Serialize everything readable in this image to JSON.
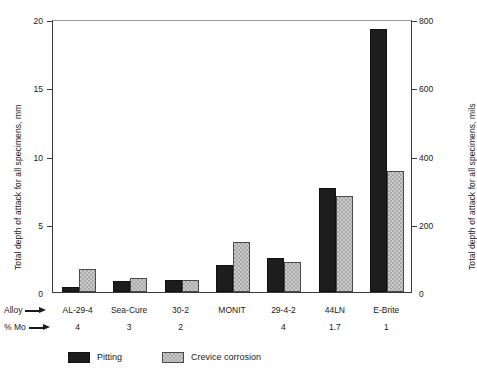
{
  "chart_data": {
    "type": "bar",
    "title": "",
    "xlabel": "Alloy",
    "ylabel": "Total depth of attack for all specimens, mm",
    "ylabel_right": "Total depth of attack for all specimens, mils",
    "categories": [
      "AL-29-4",
      "Sea-Cure",
      "30-2",
      "MONIT",
      "29-4-2",
      "44LN",
      "E-Brite"
    ],
    "series": [
      {
        "name": "Pitting",
        "color": "#1d1d1d",
        "values": [
          0.4,
          0.8,
          0.9,
          2.0,
          2.5,
          7.6,
          19.3
        ]
      },
      {
        "name": "Crevice corrosion",
        "color": "#c9c9c9",
        "values": [
          1.7,
          1.0,
          0.85,
          3.7,
          2.2,
          7.0,
          8.9
        ]
      }
    ],
    "ylim": [
      0,
      20
    ],
    "yticks": [
      0,
      5,
      10,
      15,
      20
    ],
    "ylim_right": [
      0,
      800
    ],
    "yticks_right": [
      0,
      200,
      400,
      600,
      800
    ],
    "grid": false,
    "legend_position": "bottom-left",
    "secondary_axis": {
      "label": "Total depth of attack for all specimens, mils",
      "conversion": "1 mm = 39.37 mils"
    }
  },
  "axes": {
    "left": {
      "title": "Total depth of attack for all specimens, mm",
      "ticks": [
        {
          "value": 20,
          "label": "20"
        },
        {
          "value": 15,
          "label": "15"
        },
        {
          "value": 10,
          "label": "10"
        },
        {
          "value": 5,
          "label": "5"
        },
        {
          "value": 0,
          "label": "0"
        }
      ]
    },
    "right": {
      "title": "Total depth of attack for all specimens, mils",
      "ticks": [
        {
          "value": 800,
          "label": "800"
        },
        {
          "value": 600,
          "label": "600"
        },
        {
          "value": 400,
          "label": "400"
        },
        {
          "value": 200,
          "label": "200"
        },
        {
          "value": 0,
          "label": "0"
        }
      ]
    }
  },
  "rows": {
    "alloy_caption": "Alloy",
    "mo_caption": "% Mo",
    "alloy_values": [
      "AL-29-4",
      "Sea-Cure",
      "30-2",
      "MONIT",
      "29-4-2",
      "44LN",
      "E-Brite"
    ],
    "mo_values": [
      "4",
      "3",
      "2",
      "",
      "4",
      "1.7",
      "1"
    ]
  },
  "legend": {
    "items": [
      {
        "label": "Pitting",
        "swatch": "solid-dark"
      },
      {
        "label": "Crevice corrosion",
        "swatch": "stippled-light"
      }
    ]
  },
  "caption": {
    "text": ""
  }
}
